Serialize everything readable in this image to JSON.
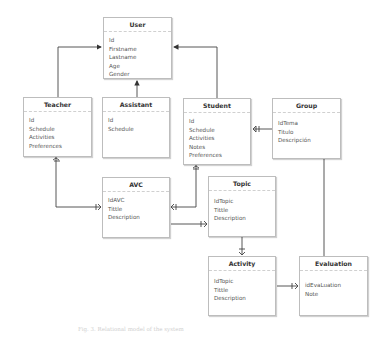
{
  "diagram": {
    "type": "entity-relationship",
    "entities": [
      {
        "name": "User",
        "fields": [
          "Id",
          "Firstname",
          "Lastname",
          "Age",
          "Gender"
        ]
      },
      {
        "name": "Teacher",
        "fields": [
          "Id",
          "Schedule",
          "Activities",
          "Preferences"
        ]
      },
      {
        "name": "Assistant",
        "fields": [
          "Id",
          "Schedule"
        ]
      },
      {
        "name": "Student",
        "fields": [
          "Id",
          "Schedule",
          "Activities",
          "Notes",
          "Preferences"
        ]
      },
      {
        "name": "Group",
        "fields": [
          "IdTema",
          "Titulo",
          "Descripción"
        ]
      },
      {
        "name": "AVC",
        "fields": [
          "IdAVC",
          "Tittle",
          "Description"
        ]
      },
      {
        "name": "Topic",
        "fields": [
          "IdTopic",
          "Tittle",
          "Description"
        ]
      },
      {
        "name": "Activity",
        "fields": [
          "IdTopic",
          "Tittle",
          "Description"
        ]
      },
      {
        "name": "Evaluation",
        "fields": [
          "idEvaLuation",
          "Note"
        ]
      }
    ],
    "relationships": [
      {
        "from": "Teacher",
        "to": "User",
        "kind": "inheritance"
      },
      {
        "from": "Assistant",
        "to": "User",
        "kind": "inheritance"
      },
      {
        "from": "Student",
        "to": "User",
        "kind": "inheritance"
      },
      {
        "from": "Group",
        "to": "Student",
        "kind": "one-to-many"
      },
      {
        "from": "Teacher",
        "to": "AVC",
        "kind": "one-to-many"
      },
      {
        "from": "Student",
        "to": "AVC",
        "kind": "many-to-many"
      },
      {
        "from": "AVC",
        "to": "Topic",
        "kind": "one-to-many"
      },
      {
        "from": "Topic",
        "to": "Activity",
        "kind": "one-to-many"
      },
      {
        "from": "Activity",
        "to": "Evaluation",
        "kind": "one-to-many"
      },
      {
        "from": "Group",
        "to": "Evaluation",
        "kind": "association"
      }
    ],
    "caption": "Fig. 3. Relational model of the system"
  }
}
